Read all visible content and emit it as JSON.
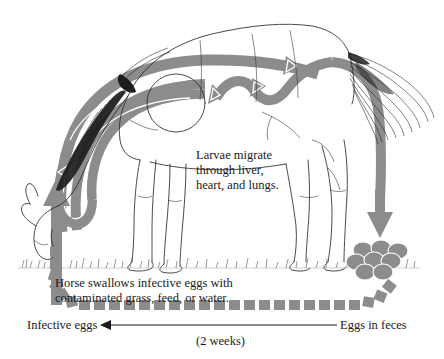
{
  "diagram": {
    "subject": "horse",
    "type": "life-cycle-flow",
    "colors": {
      "arrow_gray": "#8c8c8c",
      "outline_black": "#1a1a1a",
      "background": "#ffffff",
      "text": "#1a1a1a",
      "arrow_highlight": "#ffffff"
    },
    "captions": {
      "larvae": {
        "lines": [
          "Larvae migrate",
          "through liver,",
          "heart, and lungs."
        ],
        "full": "Larvae migrate through liver, heart, and lungs."
      },
      "swallow": {
        "lines": [
          "Horse swallows infective eggs with",
          "contaminated grass, feed, or water."
        ],
        "full": "Horse swallows infective eggs with contaminated grass, feed, or water."
      }
    },
    "labels": {
      "infective_eggs": "Infective eggs",
      "eggs_in_feces": "Eggs in feces",
      "duration": "(2 weeks)"
    },
    "stages": [
      {
        "order": 1,
        "name": "ingestion",
        "label": "Horse swallows infective eggs with contaminated grass, feed, or water."
      },
      {
        "order": 2,
        "name": "migration",
        "label": "Larvae migrate through liver, heart, and lungs."
      },
      {
        "order": 3,
        "name": "shedding",
        "label": "Eggs in feces"
      },
      {
        "order": 4,
        "name": "maturation",
        "label": "Infective eggs",
        "duration": "(2 weeks)"
      }
    ],
    "elements": {
      "horse": "horse-line-drawing-grazing",
      "mane": "mane-hatched",
      "tail": "tail-plume",
      "grass": "grass-tufts-ground-line",
      "feces": "feces-pile",
      "egg_chain": "egg-square-chain",
      "timeline_arrow": "leftward-timeline-arrow"
    }
  }
}
